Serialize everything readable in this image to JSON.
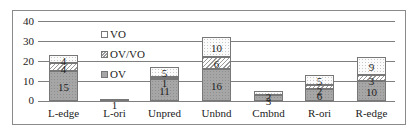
{
  "chart_data": {
    "type": "bar",
    "stacked": true,
    "title": "",
    "xlabel": "",
    "ylabel": "",
    "ylim": [
      0,
      40
    ],
    "yticks": [
      "0",
      "10",
      "20",
      "30",
      "40"
    ],
    "grid": true,
    "legend_position": "upper-left-inside",
    "categories": [
      "L-edge",
      "L-ori",
      "Unpred",
      "Unbnd",
      "Cmbnd",
      "R-ori",
      "R-edge"
    ],
    "series": [
      {
        "name": "OV",
        "values": [
          15,
          1,
          11,
          16,
          3,
          6,
          10
        ]
      },
      {
        "name": "OV/VO",
        "values": [
          4,
          0,
          1,
          6,
          0,
          2,
          3
        ]
      },
      {
        "name": "VO",
        "values": [
          4,
          0,
          5,
          10,
          2,
          5,
          9
        ]
      }
    ],
    "legend": [
      "VO",
      "OV/VO",
      "OV"
    ]
  },
  "colors": {
    "OV": "#a6a6a6",
    "OV/VO": "#d0d0d0",
    "VO": "#ffffff",
    "grid": "#7f7f7f"
  }
}
